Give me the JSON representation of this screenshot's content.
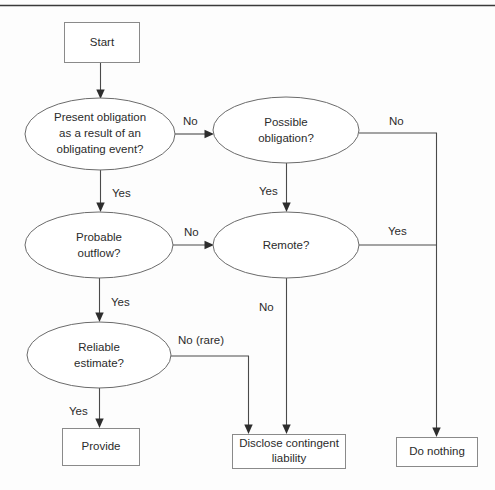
{
  "diagram": {
    "colors": {
      "background": "#fdfdfd",
      "shape_stroke": "#6b6b6b",
      "box_stroke": "#8a8a8a",
      "connector": "#4a4a4a",
      "text": "#2b2b2b",
      "top_rule": "#3a3a3a"
    },
    "top_rule_present": true,
    "nodes": [
      {
        "id": "start",
        "type": "process-box",
        "lines": [
          "Start"
        ],
        "x": 64,
        "y": 22,
        "w": 75,
        "h": 40
      },
      {
        "id": "present-obligation",
        "type": "decision-ellipse",
        "lines": [
          "Present obligation",
          "as a result of an",
          "obligating event?"
        ],
        "cx": 100,
        "cy": 134,
        "rx": 75,
        "ry": 36
      },
      {
        "id": "possible-obligation",
        "type": "decision-ellipse",
        "lines": [
          "Possible",
          "obligation?"
        ],
        "cx": 286,
        "cy": 130,
        "rx": 73,
        "ry": 33
      },
      {
        "id": "probable-outflow",
        "type": "decision-ellipse",
        "lines": [
          "Probable",
          "outflow?"
        ],
        "cx": 99,
        "cy": 245,
        "rx": 74,
        "ry": 33
      },
      {
        "id": "remote",
        "type": "decision-ellipse",
        "lines": [
          "Remote?"
        ],
        "cx": 286,
        "cy": 245,
        "rx": 73,
        "ry": 33
      },
      {
        "id": "reliable-estimate",
        "type": "decision-ellipse",
        "lines": [
          "Reliable",
          "estimate?"
        ],
        "cx": 99,
        "cy": 355,
        "rx": 72,
        "ry": 33
      },
      {
        "id": "provide",
        "type": "process-box",
        "lines": [
          "Provide"
        ],
        "x": 62,
        "y": 428,
        "w": 77,
        "h": 37
      },
      {
        "id": "disclose",
        "type": "process-box",
        "lines": [
          "Disclose contingent",
          "liability"
        ],
        "x": 232,
        "y": 434,
        "w": 113,
        "h": 34
      },
      {
        "id": "do-nothing",
        "type": "process-box",
        "lines": [
          "Do nothing"
        ],
        "x": 396,
        "y": 437,
        "w": 81,
        "h": 29
      }
    ],
    "edge_labels": [
      {
        "id": "start-to-present",
        "text": "",
        "x": 0,
        "y": 0
      },
      {
        "id": "present-no",
        "text": "No",
        "x": 183,
        "y": 122
      },
      {
        "id": "present-yes",
        "text": "Yes",
        "x": 112,
        "y": 194
      },
      {
        "id": "possible-no",
        "text": "No",
        "x": 389,
        "y": 122
      },
      {
        "id": "possible-yes",
        "text": "Yes",
        "x": 259,
        "y": 192
      },
      {
        "id": "probable-no",
        "text": "No",
        "x": 184,
        "y": 233
      },
      {
        "id": "probable-yes",
        "text": "Yes",
        "x": 111,
        "y": 303
      },
      {
        "id": "remote-yes",
        "text": "Yes",
        "x": 388,
        "y": 232
      },
      {
        "id": "remote-no",
        "text": "No",
        "x": 259,
        "y": 308
      },
      {
        "id": "reliable-no-rare",
        "text": "No (rare)",
        "x": 178,
        "y": 341
      },
      {
        "id": "reliable-yes",
        "text": "Yes",
        "x": 69,
        "y": 412
      }
    ],
    "flow_summary": {
      "decisions": [
        "Present obligation as a result of an obligating event?",
        "Possible obligation?",
        "Probable outflow?",
        "Remote?",
        "Reliable estimate?"
      ],
      "outcomes": [
        "Provide",
        "Disclose contingent liability",
        "Do nothing"
      ]
    }
  }
}
